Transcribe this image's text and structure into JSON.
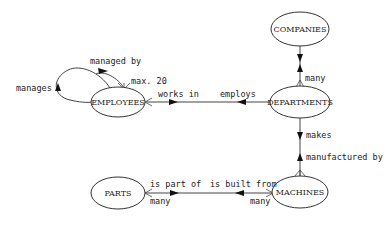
{
  "entities": {
    "companies": "COMPANIES",
    "employees": "EMPLOYEES",
    "departments": "DEPARTMENTS",
    "parts": "PARTS",
    "machines": "MACHINES"
  },
  "relationships": {
    "self_loop": {
      "forward": "managed by",
      "reverse": "manages",
      "cardinality": "max. 20"
    },
    "employees_departments": {
      "forward": "works in",
      "reverse": "employs"
    },
    "companies_departments": {
      "cardinality": "many"
    },
    "departments_machines": {
      "forward": "makes",
      "reverse": "manufactured by"
    },
    "parts_machines": {
      "forward": "is part of",
      "reverse": "is built from",
      "cardinality_parts": "many",
      "cardinality_machines": "many"
    }
  },
  "colors": {
    "line": "#444444",
    "arrow": "#111111",
    "text": "#222222",
    "background": "#ffffff"
  }
}
